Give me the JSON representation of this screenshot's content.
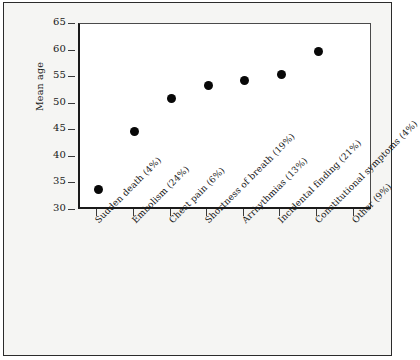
{
  "chart_data": {
    "type": "scatter",
    "title": "",
    "xlabel": "",
    "ylabel": "Mean age",
    "ylim": [
      30,
      65
    ],
    "yticks": [
      30,
      35,
      40,
      45,
      50,
      55,
      60,
      65
    ],
    "grid": false,
    "legend": "none",
    "categories": [
      "Sudden death (4%)",
      "Embolism (24%)",
      "Chest pain (6%)",
      "Shortness of breath (19%)",
      "Arrhythmias (13%)",
      "Incidental finding (21%)",
      "Constitutional symptoms (4%)",
      "Other (9%)"
    ],
    "values": [
      33.9,
      44.7,
      50.9,
      53.5,
      54.3,
      55.5,
      59.8,
      null
    ],
    "point_color": "#080808",
    "axis_color": "#1a1a1a",
    "plot_background": "#ffffff",
    "panel_background": "#f5f5f3"
  }
}
